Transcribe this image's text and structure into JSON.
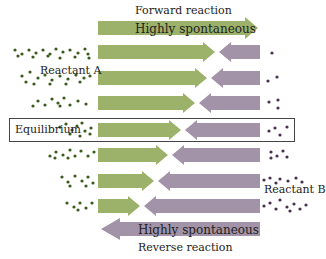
{
  "labels": {
    "forward": "Forward reaction",
    "forward_arrow": "Highly spontaneous",
    "reactant_a": "Reactant  A",
    "equilibrium": "Equilibrium",
    "reactant_b": "Reactant B",
    "reverse_arrow": "Highly spontaneous",
    "reverse": "Reverse reaction"
  },
  "colors": {
    "forward_arrow": "#9cb26a",
    "reverse_arrow": "#a393a8",
    "reactant_a_dot": "#3d5a1e",
    "reactant_b_dot": "#4a3050",
    "box_border": "#444444"
  },
  "rows": [
    {
      "y": 52,
      "meet_x": 215
    },
    {
      "y": 78,
      "meet_x": 207
    },
    {
      "y": 103,
      "meet_x": 195
    },
    {
      "y": 130,
      "meet_x": 181
    },
    {
      "y": 155,
      "meet_x": 168
    },
    {
      "y": 181,
      "meet_x": 154
    },
    {
      "y": 206,
      "meet_x": 140
    }
  ],
  "equilibrium_row_index": 3
}
